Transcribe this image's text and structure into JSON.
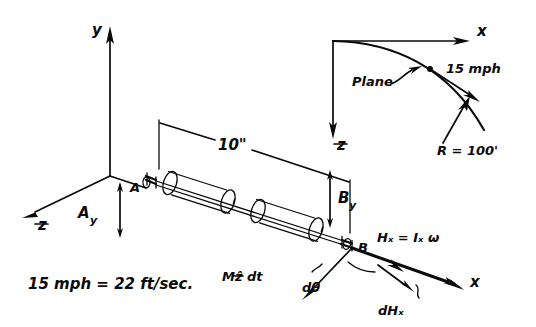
{
  "figure": {
    "background_color": "#ffffff",
    "ink_color": "#0a0a0a",
    "width": 536,
    "height": 327
  },
  "main_view": {
    "name": "3D shaft assembly with body axes",
    "axes": [
      {
        "id": "y",
        "label": "y",
        "direction": "up"
      },
      {
        "id": "zb",
        "label": "z",
        "overbar": true,
        "direction": "down-left"
      },
      {
        "id": "x",
        "label": "x",
        "direction": "down-right"
      }
    ],
    "bearings": [
      {
        "id": "A",
        "label": "A",
        "position": "left end of shaft"
      },
      {
        "id": "B",
        "label": "B",
        "position": "right end of shaft"
      }
    ],
    "reactions": [
      {
        "id": "Ay",
        "label": "A",
        "subscript": "y",
        "arrow": "down"
      },
      {
        "id": "By",
        "label": "B",
        "subscript": "y",
        "arrow": "up"
      }
    ],
    "dimension": {
      "id": "shaft-length",
      "value": "10\"",
      "between": [
        "A",
        "B"
      ]
    }
  },
  "plan_view": {
    "name": "Top view of plane flight path",
    "axes": [
      {
        "id": "x",
        "label": "x",
        "direction": "right"
      },
      {
        "id": "z",
        "label": "z",
        "overbar": true,
        "direction": "down"
      }
    ],
    "plane_label": "Plane",
    "speed_label": "15 mph",
    "radius_label": "R = 100'"
  },
  "momentum_diagram": {
    "name": "Angular momentum vector triangle",
    "momentum_label": "H",
    "momentum_equation": "Hₓ = Iₓ ω",
    "moment_impulse_label": "M",
    "moment_impulse_equation": "Mẑ dt",
    "angle_label": "dθ",
    "delta_label": "dHₓ",
    "axis_label": "x"
  },
  "notes": {
    "conversion": "15 mph = 22 ft/sec."
  }
}
